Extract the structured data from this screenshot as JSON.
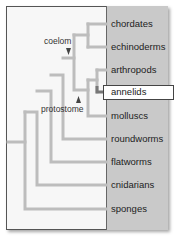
{
  "diagram": {
    "type": "phylogenetic-tree",
    "taxa": [
      {
        "label": "chordates",
        "y": 24
      },
      {
        "label": "echinoderms",
        "y": 47
      },
      {
        "label": "arthropods",
        "y": 70
      },
      {
        "label": "annelids",
        "y": 92,
        "highlighted": true
      },
      {
        "label": "molluscs",
        "y": 116
      },
      {
        "label": "roundworms",
        "y": 139
      },
      {
        "label": "flatworms",
        "y": 162
      },
      {
        "label": "cnidarians",
        "y": 185
      },
      {
        "label": "sponges",
        "y": 209
      }
    ],
    "annotations": [
      {
        "label": "coelom",
        "arrow": "down"
      },
      {
        "label": "protostome",
        "arrow": "up"
      }
    ],
    "colors": {
      "branch": "#bdbdbd",
      "highlight_branch": "#777777",
      "panel": "#c9c9c9",
      "frame_bg": "#f7f7f7"
    }
  }
}
